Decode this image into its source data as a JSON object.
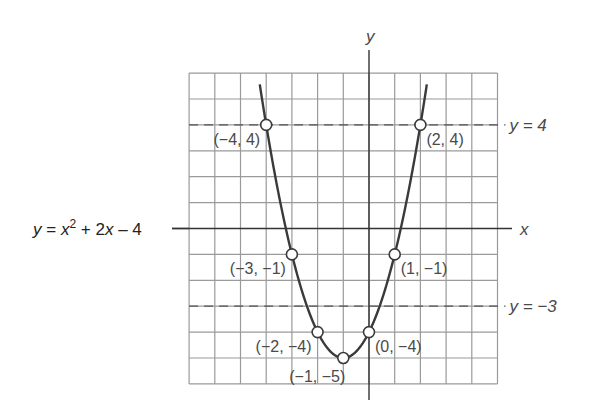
{
  "chart_data": {
    "type": "line",
    "title": "",
    "equation_label": {
      "lhs": "y",
      "eq": " = ",
      "x": "x",
      "sup": "2",
      "rest": " + 2",
      "x2": "x",
      "tail": " – 4"
    },
    "function": {
      "a": 1,
      "b": 2,
      "c": -4,
      "x_range": [
        -4.25,
        2.25
      ]
    },
    "xlabel": "x",
    "ylabel": "y",
    "xlim": [
      -7,
      5
    ],
    "ylim": [
      -6,
      6
    ],
    "grid": true,
    "reference_lines": [
      {
        "y": 4,
        "label": "y = 4",
        "style": "dashed"
      },
      {
        "y": -3,
        "label": "y = −3",
        "style": "dashed"
      }
    ],
    "points": [
      {
        "x": -4,
        "y": 4,
        "label": "(−4, 4)",
        "label_side": "left"
      },
      {
        "x": 2,
        "y": 4,
        "label": "(2, 4)",
        "label_side": "right"
      },
      {
        "x": -3,
        "y": -1,
        "label": "(−3, −1)",
        "label_side": "left"
      },
      {
        "x": 1,
        "y": -1,
        "label": "(1, −1)",
        "label_side": "right"
      },
      {
        "x": -2,
        "y": -4,
        "label": "(−2, −4)",
        "label_side": "left"
      },
      {
        "x": 0,
        "y": -4,
        "label": "(0, −4)",
        "label_side": "right"
      },
      {
        "x": -1,
        "y": -5,
        "label": "(−1, −5)",
        "label_side": "below-left"
      }
    ],
    "colors": {
      "grid": "#9a9a9a",
      "axis": "#333333",
      "curve": "#3a3a3a",
      "dashed": "#555555",
      "text": "#4a4a4a"
    }
  }
}
